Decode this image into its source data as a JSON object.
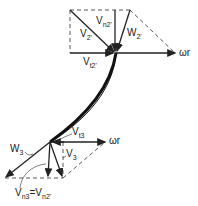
{
  "diagram": {
    "colors": {
      "line": "#222222",
      "background": "#ffffff"
    },
    "top_triangle": {
      "labels": {
        "v2": {
          "main": "V",
          "sub": "2'"
        },
        "vn2": {
          "main": "V",
          "sub": "n2'"
        },
        "w2": {
          "main": "W",
          "sub": "2'"
        },
        "vt2": {
          "main": "V",
          "sub": "t2'"
        },
        "omega_r": "ωr"
      }
    },
    "bottom_triangle": {
      "labels": {
        "w3": {
          "main": "W",
          "sub": "3"
        },
        "vt3": {
          "main": "V",
          "sub": "t3"
        },
        "v3": {
          "main": "V",
          "sub": "3"
        },
        "omega_r": "ωr",
        "vn3_eq": {
          "left_main": "V",
          "left_sub": "n3",
          "eq": "=",
          "right_main": "V",
          "right_sub": "n2'"
        }
      }
    }
  }
}
